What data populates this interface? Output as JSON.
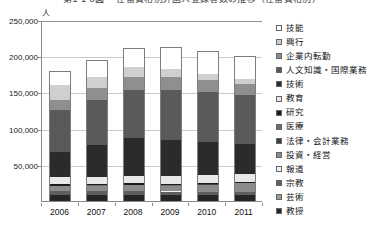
{
  "title": "第1-1-8図 　在留資格別外国人登録者数の推移（在留資格別）",
  "axis_unit": "人",
  "chart_data": {
    "type": "bar",
    "stacked": true,
    "title": "第1-1-8図 　在留資格別外国人登録者数の推移（在留資格別）",
    "xlabel": "",
    "ylabel": "人",
    "ylim": [
      0,
      250000
    ],
    "ytick_values": [
      0,
      50000,
      100000,
      150000,
      200000,
      250000
    ],
    "ytick_labels": [
      "0",
      "50,000",
      "100,000",
      "150,000",
      "200,000",
      "250,000"
    ],
    "grid": true,
    "legend_position": "right",
    "categories": [
      "2006",
      "2007",
      "2008",
      "2009",
      "2010",
      "2011"
    ],
    "series": [
      {
        "name": "教授",
        "color": "#262626",
        "values": [
          8400,
          8500,
          8600,
          8300,
          8100,
          7900
        ]
      },
      {
        "name": "芸術",
        "color": "#9a9a9a",
        "values": [
          400,
          400,
          400,
          400,
          400,
          400
        ]
      },
      {
        "name": "宗教",
        "color": "#5e5e5e",
        "values": [
          4700,
          4600,
          4500,
          4400,
          4200,
          4100
        ]
      },
      {
        "name": "報道",
        "color": "#f2f2f2",
        "values": [
          300,
          300,
          300,
          300,
          300,
          300
        ]
      },
      {
        "name": "投資・経営",
        "color": "#8c8c8c",
        "values": [
          7200,
          7400,
          7700,
          7800,
          9800,
          11800
        ]
      },
      {
        "name": "法律・会計業務",
        "color": "#3f3f3f",
        "values": [
          200,
          200,
          200,
          200,
          200,
          200
        ]
      },
      {
        "name": "医療",
        "color": "#6e6e6e",
        "values": [
          200,
          200,
          200,
          300,
          300,
          300
        ]
      },
      {
        "name": "研究",
        "color": "#1c1c1c",
        "values": [
          2500,
          2400,
          2400,
          2300,
          2100,
          1900
        ]
      },
      {
        "name": "教育",
        "color": "#e8e8e8",
        "values": [
          9400,
          9700,
          10100,
          10100,
          10000,
          10000
        ]
      },
      {
        "name": "技術",
        "color": "#2b2b2b",
        "values": [
          35100,
          44300,
          52300,
          50500,
          46600,
          42600
        ]
      },
      {
        "name": "人文知識・国際業務",
        "color": "#5a5a5a",
        "values": [
          57300,
          61800,
          67300,
          69400,
          68500,
          67000
        ]
      },
      {
        "name": "企業内転勤",
        "color": "#8f8f8f",
        "values": [
          14000,
          16000,
          17800,
          17500,
          16100,
          15000
        ]
      },
      {
        "name": "興行",
        "color": "#cfcfcf",
        "values": [
          21100,
          15700,
          13000,
          10900,
          9200,
          7500
        ]
      },
      {
        "name": "技能",
        "color": "#ffffff",
        "values": [
          17400,
          21600,
          25900,
          29000,
          30100,
          29800
        ]
      }
    ],
    "totals": [
      178200,
      193100,
      210700,
      211400,
      205900,
      198600
    ],
    "legend_order_top_to_bottom": [
      "技能",
      "興行",
      "企業内転勤",
      "人文知識・国際業務",
      "技術",
      "教育",
      "研究",
      "医療",
      "法律・会計業務",
      "投資・経営",
      "報道",
      "宗教",
      "芸術",
      "教授"
    ]
  }
}
